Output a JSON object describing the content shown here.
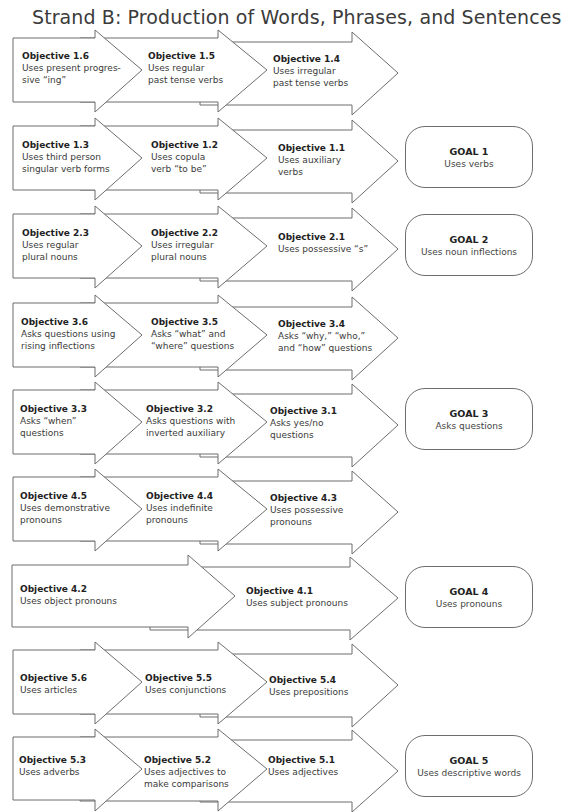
{
  "title": "Strand B: Production of Words, Phrases, and Sentences",
  "rows": [
    {
      "objectives": [
        {
          "id": "Objective 1.6",
          "text": "Uses present progres-\nsive “ing”"
        },
        {
          "id": "Objective 1.5",
          "text": "Uses regular\npast tense verbs"
        },
        {
          "id": "Objective 1.4",
          "text": "Uses irregular\npast tense verbs"
        }
      ]
    },
    {
      "objectives": [
        {
          "id": "Objective 1.3",
          "text": "Uses third person\nsingular verb forms"
        },
        {
          "id": "Objective 1.2",
          "text": "Uses copula\nverb “to be”"
        },
        {
          "id": "Objective 1.1",
          "text": "Uses auxiliary\nverbs"
        }
      ],
      "goal": {
        "title": "GOAL 1",
        "text": "Uses verbs"
      }
    },
    {
      "objectives": [
        {
          "id": "Objective 2.3",
          "text": "Uses regular\nplural nouns"
        },
        {
          "id": "Objective 2.2",
          "text": "Uses irregular\nplural nouns"
        },
        {
          "id": "Objective 2.1",
          "text": "Uses possessive “s”"
        }
      ],
      "goal": {
        "title": "GOAL 2",
        "text": "Uses noun inflections"
      }
    },
    {
      "objectives": [
        {
          "id": "Objective 3.6",
          "text": "Asks questions using\nrising inflections"
        },
        {
          "id": "Objective 3.5",
          "text": "Asks “what” and\n“where” questions"
        },
        {
          "id": "Objective 3.4",
          "text": "Asks “why,” “who,”\nand “how” questions"
        }
      ]
    },
    {
      "objectives": [
        {
          "id": "Objective 3.3",
          "text": "Asks “when”\nquestions"
        },
        {
          "id": "Objective 3.2",
          "text": "Asks questions with\ninverted auxiliary"
        },
        {
          "id": "Objective 3.1",
          "text": "Asks yes/no\nquestions"
        }
      ],
      "goal": {
        "title": "GOAL 3",
        "text": "Asks questions"
      }
    },
    {
      "objectives": [
        {
          "id": "Objective 4.5",
          "text": "Uses demonstrative\npronouns"
        },
        {
          "id": "Objective 4.4",
          "text": "Uses indefinite\npronouns"
        },
        {
          "id": "Objective 4.3",
          "text": "Uses possessive\npronouns"
        }
      ]
    },
    {
      "objectives": [
        {
          "id": "Objective 4.2",
          "text": "Uses object pronouns"
        },
        {
          "id": "Objective 4.1",
          "text": "Uses subject pronouns"
        }
      ],
      "goal": {
        "title": "GOAL 4",
        "text": "Uses pronouns"
      }
    },
    {
      "objectives": [
        {
          "id": "Objective 5.6",
          "text": "Uses articles"
        },
        {
          "id": "Objective 5.5",
          "text": "Uses conjunctions"
        },
        {
          "id": "Objective 5.4",
          "text": "Uses prepositions"
        }
      ]
    },
    {
      "objectives": [
        {
          "id": "Objective 5.3",
          "text": "Uses adverbs"
        },
        {
          "id": "Objective 5.2",
          "text": "Uses adjectives to\nmake comparisons"
        },
        {
          "id": "Objective 5.1",
          "text": "Uses adjectives"
        }
      ],
      "goal": {
        "title": "GOAL 5",
        "text": "Uses descriptive words"
      }
    }
  ]
}
